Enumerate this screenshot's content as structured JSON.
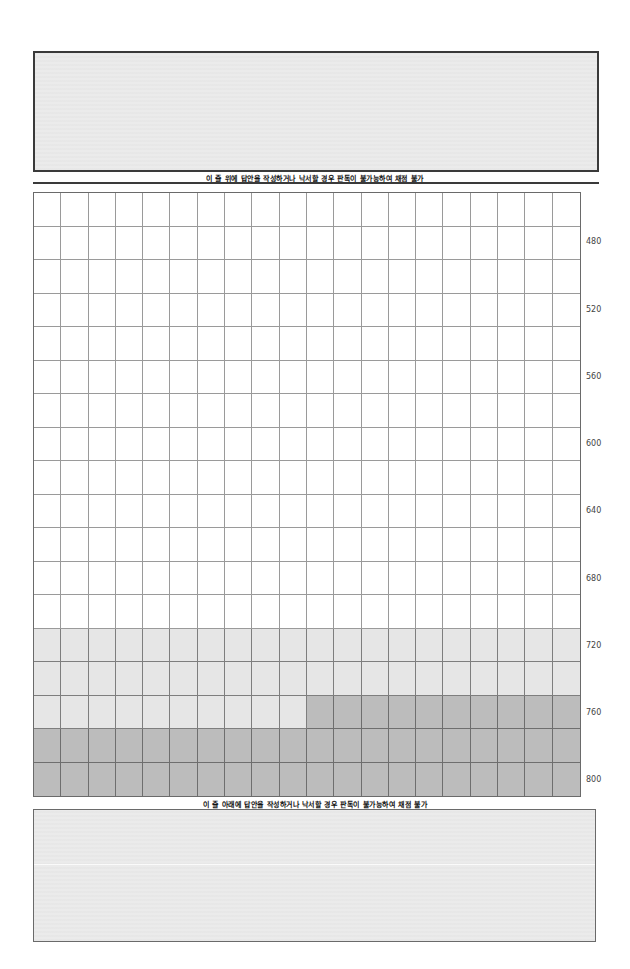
{
  "top_answer_box": {
    "fill_color": "#ebebeb",
    "border_color": "#3a3a3a"
  },
  "captions": {
    "above_line": "이 줄 위에 답안을 작성하거나 낙서할 경우 판독이 불가능하여 채점 불가",
    "below_line": "이 줄 아래에 답안을 작성하거나 낙서할 경우 판독이 불가능하여 채점 불가"
  },
  "answer_grid": {
    "columns": 20,
    "rows": 18,
    "row_labels": [
      {
        "row": 1,
        "label": "480"
      },
      {
        "row": 3,
        "label": "520"
      },
      {
        "row": 5,
        "label": "560"
      },
      {
        "row": 7,
        "label": "600"
      },
      {
        "row": 9,
        "label": "640"
      },
      {
        "row": 11,
        "label": "680"
      },
      {
        "row": 13,
        "label": "720"
      },
      {
        "row": 15,
        "label": "760"
      },
      {
        "row": 17,
        "label": "800"
      }
    ],
    "shading": {
      "light_rows_start": 13,
      "dark_partial_row": 15,
      "dark_partial_from_col": 10,
      "dark_full_rows_start": 16,
      "light_color": "#e6e6e6",
      "dark_color": "#bcbcbc"
    }
  },
  "bottom_answer_box": {
    "fill_color": "#ebebeb",
    "border_color": "#6a6a6a"
  }
}
